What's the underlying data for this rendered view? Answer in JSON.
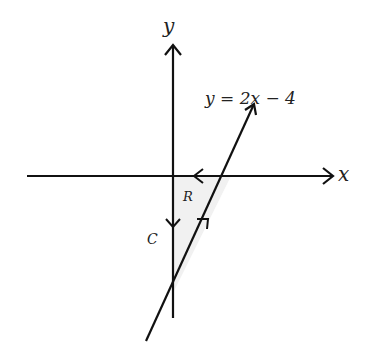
{
  "diagram": {
    "axis_labels": {
      "x": "x",
      "y": "y"
    },
    "line_equation": "y = 2x − 4",
    "region_label": "R",
    "curve_label": "C",
    "colors": {
      "stroke": "#111111",
      "region_fill": "#f1f1f1",
      "text": "#222222"
    }
  }
}
